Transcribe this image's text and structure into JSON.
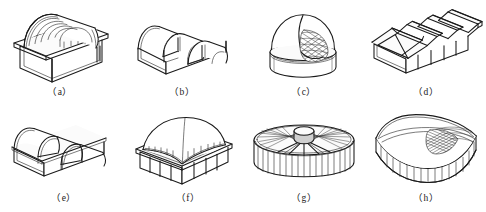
{
  "figure": {
    "background_color": "#ffffff",
    "line_color": "#1a1a1a",
    "columns": 4,
    "rows": 2
  },
  "items": [
    {
      "key": "a",
      "label": "（a）",
      "name": "barrel-vault-single-span",
      "description": "Single long cylindrical barrel shell roof on rectangular base with end arch opening",
      "roof_type": "cylindrical barrel shell",
      "bays": 1,
      "ribs": 5
    },
    {
      "key": "b",
      "label": "（b）",
      "name": "barrel-vault-multi-bay",
      "description": "Three-bay multiple barrel shell vault with open arched ends",
      "roof_type": "multi-bay barrel shell",
      "bays": 3,
      "ribs": 0
    },
    {
      "key": "c",
      "label": "（c）",
      "name": "spherical-dome-lattice",
      "description": "Spherical dome on cylindrical drum with cut-away showing triangulated lattice grid",
      "roof_type": "spherical dome",
      "bays": 1,
      "ribs": 0
    },
    {
      "key": "d",
      "label": "（d）",
      "name": "folded-plate-north-light",
      "description": "Folded plate / saw-tooth north-light shell roof over rectangular base with five bays",
      "roof_type": "folded plate shell",
      "bays": 5,
      "ribs": 0
    },
    {
      "key": "e",
      "label": "（e）",
      "name": "barrel-vault-three-bay-closed",
      "description": "Three-bay barrel shell roof with closed gable walls on rectangular base",
      "roof_type": "multi-bay barrel shell",
      "bays": 3,
      "ribs": 0
    },
    {
      "key": "f",
      "label": "（f）",
      "name": "dome-on-square-base",
      "description": "Spherical shell dome seated on a square base with perimeter arched edge beams",
      "roof_type": "dome on square plan",
      "bays": 1,
      "ribs": 0
    },
    {
      "key": "g",
      "label": "（g）",
      "name": "circular-suspended-cable-roof",
      "description": "Circular suspended cable roof with central ring hub and radial cables over a cylindrical drum",
      "roof_type": "suspended cable roof",
      "bays": 1,
      "ribs": 24
    },
    {
      "key": "h",
      "label": "（h）",
      "name": "saddle-hypar-shell",
      "description": "Saddle shaped hyperbolic paraboloid shell roof on curved crescent base with cable net cut-away",
      "roof_type": "hyperbolic paraboloid shell",
      "bays": 1,
      "ribs": 0
    }
  ]
}
